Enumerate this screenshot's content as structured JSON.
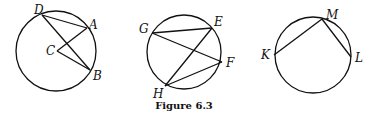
{
  "caption": "Figure 6.3",
  "figures": [
    {
      "id": "circle-c",
      "circle": {
        "cx": 56,
        "cy": 51,
        "r": 40
      },
      "points": {
        "D": {
          "x": 42,
          "y": 15,
          "lx": 34,
          "ly": 14
        },
        "A": {
          "x": 87,
          "y": 28,
          "lx": 89,
          "ly": 29
        },
        "C": {
          "x": 57,
          "y": 51,
          "lx": 46,
          "ly": 55
        },
        "B": {
          "x": 90,
          "y": 70,
          "lx": 93,
          "ly": 80
        }
      },
      "segments": [
        [
          "D",
          "A"
        ],
        [
          "D",
          "B"
        ],
        [
          "C",
          "A"
        ],
        [
          "C",
          "B"
        ]
      ]
    },
    {
      "id": "circle-efgh",
      "circle": {
        "cx": 184,
        "cy": 52,
        "r": 37
      },
      "points": {
        "G": {
          "x": 152,
          "y": 33,
          "lx": 139,
          "ly": 33
        },
        "E": {
          "x": 212,
          "y": 28,
          "lx": 214,
          "ly": 26
        },
        "F": {
          "x": 222,
          "y": 62,
          "lx": 226,
          "ly": 67
        },
        "H": {
          "x": 165,
          "y": 86,
          "lx": 153,
          "ly": 98
        }
      },
      "segments": [
        [
          "G",
          "E"
        ],
        [
          "G",
          "F"
        ],
        [
          "H",
          "E"
        ],
        [
          "H",
          "F"
        ]
      ]
    },
    {
      "id": "circle-klm",
      "circle": {
        "cx": 313,
        "cy": 55,
        "r": 38
      },
      "points": {
        "M": {
          "x": 322,
          "y": 19,
          "lx": 326,
          "ly": 19
        },
        "K": {
          "x": 274,
          "y": 55,
          "lx": 261,
          "ly": 59
        },
        "L": {
          "x": 351,
          "y": 57,
          "lx": 355,
          "ly": 62
        }
      },
      "segments": [
        [
          "M",
          "K"
        ],
        [
          "M",
          "L"
        ]
      ]
    }
  ]
}
